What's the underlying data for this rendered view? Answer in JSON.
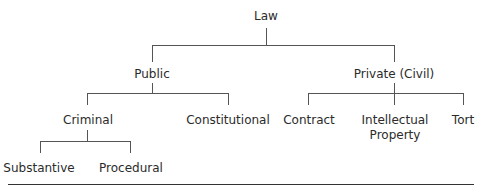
{
  "diagram": {
    "type": "tree",
    "root": "Law",
    "nodes": {
      "law": "Law",
      "public": "Public",
      "private": "Private (Civil)",
      "criminal": "Criminal",
      "constitutional": "Constitutional",
      "contract": "Contract",
      "ip_line1": "Intellectual",
      "ip_line2": "Property",
      "tort": "Tort",
      "substantive": "Substantive",
      "procedural": "Procedural"
    },
    "edges": [
      [
        "Law",
        "Public"
      ],
      [
        "Law",
        "Private (Civil)"
      ],
      [
        "Public",
        "Criminal"
      ],
      [
        "Public",
        "Constitutional"
      ],
      [
        "Private (Civil)",
        "Contract"
      ],
      [
        "Private (Civil)",
        "Intellectual Property"
      ],
      [
        "Private (Civil)",
        "Tort"
      ],
      [
        "Criminal",
        "Substantive"
      ],
      [
        "Criminal",
        "Procedural"
      ]
    ]
  }
}
